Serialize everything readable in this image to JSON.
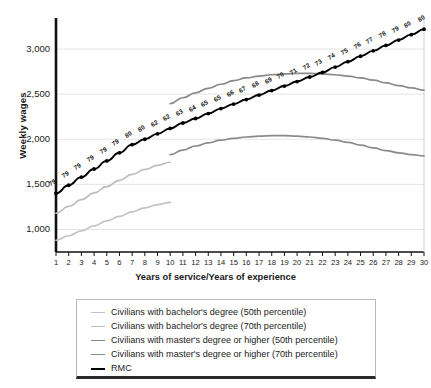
{
  "chart_data": {
    "type": "line",
    "title": "",
    "xlabel": "Years of service/Years of experience",
    "ylabel": "Weekly wages",
    "xlim": [
      1,
      30
    ],
    "ylim": [
      750,
      3300
    ],
    "grid": true,
    "yticks": [
      "1,000",
      "1,500",
      "2,000",
      "2,500",
      "3,000"
    ],
    "ytick_values": [
      1000,
      1500,
      2000,
      2500,
      3000
    ],
    "xticks": [
      "1",
      "2",
      "3",
      "4",
      "5",
      "6",
      "7",
      "8",
      "9",
      "10",
      "11",
      "12",
      "13",
      "14",
      "15",
      "16",
      "17",
      "18",
      "19",
      "20",
      "21",
      "22",
      "23",
      "24",
      "25",
      "26",
      "27",
      "28",
      "29",
      "30"
    ],
    "legend_position": "below-plot",
    "series": [
      {
        "name": "Civilians with bachelor's degree (50th percentile)",
        "color": "#c3c3c3",
        "x": [
          1,
          2,
          3,
          4,
          5,
          6,
          7,
          8,
          9,
          10
        ],
        "values": [
          880,
          930,
          985,
          1040,
          1095,
          1145,
          1195,
          1240,
          1275,
          1300
        ]
      },
      {
        "name": "Civilians with bachelor's degree (70th percentile)",
        "color": "#bdbdbd",
        "x": [
          1,
          2,
          3,
          4,
          5,
          6,
          7,
          8,
          9,
          10
        ],
        "values": [
          1180,
          1255,
          1330,
          1405,
          1475,
          1545,
          1610,
          1665,
          1710,
          1745
        ]
      },
      {
        "name": "Civilians with master's degree or higher (50th percentile)",
        "color": "#8a8a8a",
        "x": [
          10,
          11,
          12,
          13,
          14,
          15,
          16,
          17,
          18,
          19,
          20,
          21,
          22,
          23,
          24,
          25,
          26,
          27,
          28,
          29,
          30
        ],
        "values": [
          1830,
          1880,
          1925,
          1960,
          1990,
          2010,
          2025,
          2035,
          2040,
          2040,
          2035,
          2025,
          2010,
          1990,
          1965,
          1935,
          1905,
          1875,
          1850,
          1830,
          1815
        ]
      },
      {
        "name": "Civilians with master's degree or higher (70th percentile)",
        "color": "#8a8a8a",
        "x": [
          10,
          11,
          12,
          13,
          14,
          15,
          16,
          17,
          18,
          19,
          20,
          21,
          22,
          23,
          24,
          25,
          26,
          27,
          28,
          29,
          30
        ],
        "values": [
          2395,
          2460,
          2515,
          2565,
          2610,
          2650,
          2680,
          2700,
          2715,
          2725,
          2730,
          2730,
          2725,
          2715,
          2700,
          2680,
          2655,
          2625,
          2595,
          2570,
          2545
        ]
      },
      {
        "name": "RMC",
        "color": "#000000",
        "markers": true,
        "x": [
          1,
          2,
          3,
          4,
          5,
          6,
          7,
          8,
          9,
          10,
          11,
          12,
          13,
          14,
          15,
          16,
          17,
          18,
          19,
          20,
          21,
          22,
          23,
          24,
          25,
          26,
          27,
          28,
          29,
          30
        ],
        "values": [
          1400,
          1490,
          1580,
          1670,
          1760,
          1850,
          1940,
          2000,
          2060,
          2120,
          2180,
          2230,
          2285,
          2340,
          2390,
          2440,
          2490,
          2540,
          2590,
          2640,
          2690,
          2740,
          2800,
          2860,
          2920,
          2980,
          3040,
          3100,
          3160,
          3220
        ],
        "point_labels": [
          "79",
          "79",
          "79",
          "79",
          "79",
          "79",
          "80",
          "80",
          "62",
          "62",
          "63",
          "64",
          "65",
          "65",
          "66",
          "67",
          "68",
          "69",
          "70",
          "71",
          "72",
          "73",
          "74",
          "75",
          "76",
          "77",
          "78",
          "79",
          "80",
          ""
        ]
      }
    ]
  },
  "legend": {
    "items": [
      {
        "label": "Civilians with bachelor's degree (50th percentile)",
        "color": "#c3c3c3",
        "width": "1.6px"
      },
      {
        "label": "Civilians with bachelor's degree (70th percentile)",
        "color": "#bdbdbd",
        "width": "1.6px"
      },
      {
        "label": "Civilians with master's degree or higher (50th percentile)",
        "color": "#8a8a8a",
        "width": "1.8px"
      },
      {
        "label": "Civilians with master's degree or higher (70th percentile)",
        "color": "#8a8a8a",
        "width": "1.8px"
      },
      {
        "label": "RMC",
        "color": "#000000",
        "width": "2.6px"
      }
    ]
  }
}
